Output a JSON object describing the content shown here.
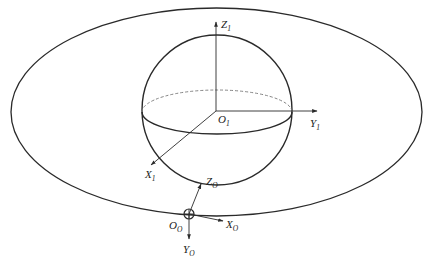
{
  "diagram": {
    "type": "coordinate-frames",
    "colors": {
      "stroke": "#2a2a2a",
      "dashed": "#777777",
      "text": "#222222"
    },
    "outer_ellipse": {
      "cx": 216.5,
      "cy": 112,
      "rx": 205.5,
      "ry": 104
    },
    "sphere": {
      "cx": 217,
      "cy": 110,
      "r": 75
    },
    "equator": {
      "cx": 217,
      "cy": 111,
      "rx": 75,
      "ry": 22
    },
    "frame_1": {
      "origin": {
        "main": "O",
        "sub": "1"
      },
      "axes": [
        {
          "main": "Z",
          "sub": "1"
        },
        {
          "main": "Y",
          "sub": "1"
        },
        {
          "main": "X",
          "sub": "1"
        }
      ]
    },
    "frame_O": {
      "origin": {
        "main": "O",
        "sub": "O"
      },
      "axes": [
        {
          "main": "Z",
          "sub": "O"
        },
        {
          "main": "X",
          "sub": "O"
        },
        {
          "main": "Y",
          "sub": "O"
        }
      ]
    }
  }
}
